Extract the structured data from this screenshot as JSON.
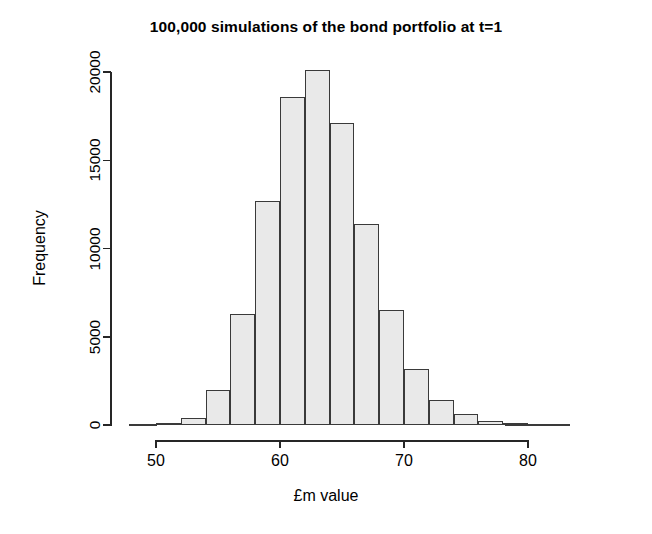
{
  "chart_data": {
    "type": "bar",
    "title": "100,000 simulations of the bond portfolio at t=1",
    "xlabel": "£m value",
    "ylabel": "Frequency",
    "grid": false,
    "legend": "none",
    "bin_width": 2,
    "xlim": [
      48,
      86
    ],
    "ylim": [
      0,
      20000
    ],
    "xticks": [
      50,
      60,
      70,
      80
    ],
    "xtick_labels": [
      "50",
      "60",
      "70",
      "80"
    ],
    "yticks": [
      0,
      5000,
      10000,
      15000,
      20000
    ],
    "ytick_labels": [
      "0",
      "5000",
      "10000",
      "15000",
      "20000"
    ],
    "bin_edges": [
      48,
      50,
      52,
      54,
      56,
      58,
      60,
      62,
      64,
      66,
      68,
      70,
      72,
      74,
      76,
      78,
      80,
      82
    ],
    "categories": [
      "48-50",
      "50-52",
      "52-54",
      "54-56",
      "56-58",
      "58-60",
      "60-62",
      "62-64",
      "64-66",
      "66-68",
      "68-70",
      "70-72",
      "72-74",
      "74-76",
      "76-78",
      "78-80",
      "80-82"
    ],
    "values": [
      20,
      60,
      400,
      2000,
      6300,
      12700,
      18600,
      20100,
      17100,
      11400,
      6500,
      3200,
      1400,
      650,
      250,
      80,
      20
    ],
    "bar_fill_color": "#e9e9e9",
    "bar_border_color": "#3a3a3a",
    "axis_color": "#262626",
    "background_color": "#ffffff"
  }
}
